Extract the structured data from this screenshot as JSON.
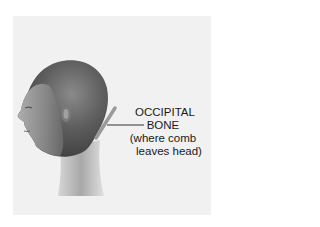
{
  "diagram": {
    "annotation": {
      "lines": [
        "OCCIPITAL",
        "BONE",
        "(where comb",
        "leaves head)"
      ],
      "pointer": "horizontal leader line from label to comb at back of head"
    },
    "comb_indicator": "angled bar at base of skull/nape",
    "colors": {
      "background": "#ffffff",
      "panel": "#f1f1f1",
      "text": "#1a1a1a",
      "head_dark": "#4a4a4a",
      "head_light": "#c8c8c8",
      "comb": "#9a9a9a"
    }
  }
}
